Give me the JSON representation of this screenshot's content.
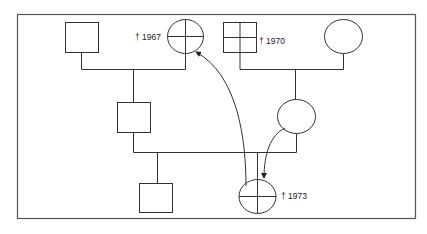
{
  "diagram": {
    "type": "pedigree",
    "line_color": "#333333",
    "frame_color": "#555555",
    "individuals": [
      {
        "id": "gf-paternal",
        "shape": "square",
        "marking": "none",
        "label": ""
      },
      {
        "id": "gm-paternal",
        "shape": "circle",
        "marking": "cross",
        "label": "† 1967"
      },
      {
        "id": "gf-maternal",
        "shape": "square",
        "marking": "cross",
        "label": "† 1970"
      },
      {
        "id": "gm-maternal",
        "shape": "circle",
        "marking": "none",
        "label": ""
      },
      {
        "id": "father",
        "shape": "square",
        "marking": "none",
        "label": ""
      },
      {
        "id": "mother",
        "shape": "circle",
        "marking": "none",
        "label": ""
      },
      {
        "id": "son",
        "shape": "square",
        "marking": "none",
        "label": ""
      },
      {
        "id": "daughter",
        "shape": "circle",
        "marking": "cross",
        "label": "† 1973"
      }
    ],
    "arrows": [
      {
        "from": "daughter",
        "to": "gm-paternal"
      },
      {
        "from": "mother",
        "to": "daughter"
      }
    ]
  }
}
